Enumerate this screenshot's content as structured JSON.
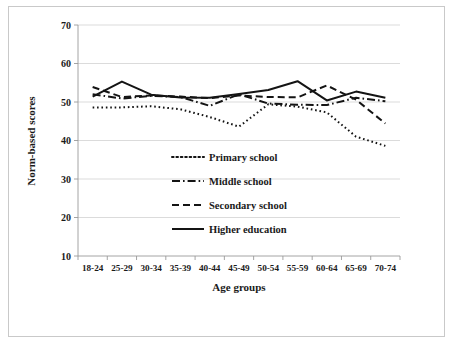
{
  "chart_data": {
    "type": "line",
    "title": "",
    "subtitle": "",
    "xlabel": "Age groups",
    "ylabel": "Norm-based scores",
    "categories": [
      "18-24",
      "25-29",
      "30-34",
      "35-39",
      "40-44",
      "45-49",
      "50-54",
      "55-59",
      "60-64",
      "65-69",
      "70-74"
    ],
    "ylim": [
      10,
      70
    ],
    "yticks": [
      10,
      20,
      30,
      40,
      50,
      60,
      70
    ],
    "grid": "horizontal",
    "legend_position": "inside-center",
    "series": [
      {
        "name": "Primary school",
        "style": "dotted",
        "values": [
          48.6,
          48.6,
          48.9,
          48.1,
          46.1,
          43.6,
          49.4,
          48.8,
          47.3,
          41.0,
          38.6
        ]
      },
      {
        "name": "Middle school",
        "style": "dash-dot",
        "values": [
          52.0,
          50.9,
          51.6,
          51.3,
          49.0,
          52.0,
          49.6,
          49.3,
          49.2,
          51.1,
          50.2
        ]
      },
      {
        "name": "Secondary school",
        "style": "dashed",
        "values": [
          53.9,
          51.3,
          51.7,
          51.4,
          51.0,
          51.7,
          51.3,
          51.2,
          54.3,
          50.6,
          44.4
        ]
      },
      {
        "name": "Higher education",
        "style": "solid",
        "values": [
          51.4,
          55.3,
          51.9,
          51.2,
          51.1,
          52.1,
          53.1,
          55.4,
          50.4,
          52.7,
          51.1
        ]
      }
    ]
  },
  "legend": {
    "items": [
      {
        "label": "Primary school",
        "style": "dotted"
      },
      {
        "label": "Middle school",
        "style": "dash-dot"
      },
      {
        "label": "Secondary school",
        "style": "dashed"
      },
      {
        "label": "Higher education",
        "style": "solid"
      }
    ]
  },
  "axes": {
    "y_title": "Norm-based scores",
    "x_title": "Age groups",
    "y_tick_labels": [
      "70",
      "60",
      "50",
      "40",
      "30",
      "20",
      "10"
    ],
    "x_tick_labels": [
      "18-24",
      "25-29",
      "30-34",
      "35-39",
      "40-44",
      "45-49",
      "50-54",
      "55-59",
      "60-64",
      "65-69",
      "70-74"
    ]
  },
  "colors": {
    "line": "#141414",
    "grid": "#d2d2d2",
    "axis": "#9a9a9a",
    "text": "#1a1a1a",
    "background": "#ffffff",
    "frame": "#c9c9c9"
  }
}
